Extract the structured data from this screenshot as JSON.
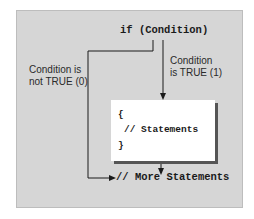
{
  "diagram": {
    "title_code": "if (Condition)",
    "true_label_line1": "Condition",
    "true_label_line2": "is TRUE (1)",
    "false_label_line1": "Condition is",
    "false_label_line2": "not TRUE (0)",
    "block": {
      "open_brace": "{",
      "statements": "// Statements",
      "close_brace": "}"
    },
    "after": "// More Statements",
    "colors": {
      "panel": "#d6d6d6",
      "box": "#ffffff",
      "line": "#1a1a1a",
      "shadow": "#555555"
    }
  }
}
